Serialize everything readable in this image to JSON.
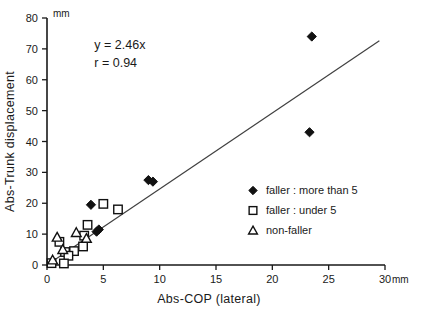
{
  "chart_data": {
    "type": "scatter",
    "title": "",
    "xlabel": "Abs-COP (lateral)",
    "ylabel": "Abs-Trunk displacement",
    "x_unit": "mm",
    "y_unit": "mm",
    "xlim": [
      0,
      30
    ],
    "ylim": [
      0,
      80
    ],
    "xticks": [
      0,
      5,
      10,
      15,
      20,
      25,
      30
    ],
    "yticks": [
      0,
      10,
      20,
      30,
      40,
      50,
      60,
      70,
      80
    ],
    "xtick_labels": [
      "0",
      "5",
      "10",
      "15",
      "20",
      "25",
      "30"
    ],
    "ytick_labels": [
      "0",
      "10",
      "20",
      "30",
      "40",
      "50",
      "60",
      "70",
      "80"
    ],
    "grid": false,
    "legend_position": "lower-right",
    "annotations": [
      {
        "text": "y = 2.46x",
        "x": 4.2,
        "y": 70
      },
      {
        "text": "r = 0.94",
        "x": 4.2,
        "y": 64
      }
    ],
    "fit_line": {
      "equation": "y = 2.46x",
      "slope": 2.46,
      "intercept": 0,
      "r": 0.94,
      "x_start": 0,
      "y_start": 0,
      "x_end": 29.5,
      "y_end": 72.6
    },
    "series": [
      {
        "name": "faller : more than 5",
        "marker": "filled-diamond",
        "color": "#111111",
        "points": [
          {
            "x": 23.5,
            "y": 74
          },
          {
            "x": 23.3,
            "y": 43
          },
          {
            "x": 9.0,
            "y": 27.5
          },
          {
            "x": 9.4,
            "y": 27.0
          },
          {
            "x": 3.9,
            "y": 19.5
          },
          {
            "x": 4.6,
            "y": 11.5
          },
          {
            "x": 4.4,
            "y": 10.8
          },
          {
            "x": 2.0,
            "y": 4.0
          }
        ]
      },
      {
        "name": "faller : under 5",
        "marker": "open-square",
        "color": "#111111",
        "points": [
          {
            "x": 6.3,
            "y": 18.0
          },
          {
            "x": 5.0,
            "y": 19.8
          },
          {
            "x": 3.6,
            "y": 13.0
          },
          {
            "x": 3.3,
            "y": 9.5
          },
          {
            "x": 3.2,
            "y": 6.0
          },
          {
            "x": 2.4,
            "y": 4.5
          },
          {
            "x": 1.6,
            "y": 4.2
          },
          {
            "x": 1.9,
            "y": 3.0
          },
          {
            "x": 1.1,
            "y": 7.5
          },
          {
            "x": 0.4,
            "y": 0.6
          },
          {
            "x": 1.5,
            "y": 0.5
          }
        ]
      },
      {
        "name": "non-faller",
        "marker": "open-triangle",
        "color": "#111111",
        "points": [
          {
            "x": 2.6,
            "y": 10.5
          },
          {
            "x": 3.5,
            "y": 8.6
          },
          {
            "x": 1.4,
            "y": 5.0
          },
          {
            "x": 0.9,
            "y": 9.0
          },
          {
            "x": 0.5,
            "y": 1.6
          }
        ]
      }
    ]
  },
  "legend": {
    "items": [
      {
        "label": "faller : more than 5",
        "marker": "filled-diamond"
      },
      {
        "label": "faller : under 5",
        "marker": "open-square"
      },
      {
        "label": "non-faller",
        "marker": "open-triangle"
      }
    ]
  }
}
